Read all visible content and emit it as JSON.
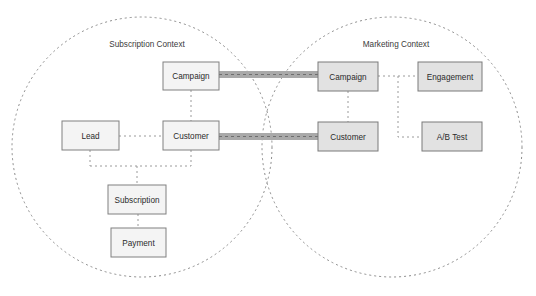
{
  "diagram": {
    "background_color": "#ffffff",
    "contexts": [
      {
        "id": "subscription-context",
        "label": "Subscription Context",
        "cx": 142,
        "cy": 147,
        "r": 130,
        "label_x": 147,
        "label_y": 45
      },
      {
        "id": "marketing-context",
        "label": "Marketing Context",
        "cx": 392,
        "cy": 147,
        "r": 130,
        "label_x": 396,
        "label_y": 45
      }
    ],
    "nodes": [
      {
        "id": "subscription-campaign",
        "label": "Campaign",
        "context": "subscription-context",
        "x": 163,
        "y": 62,
        "w": 56,
        "h": 28,
        "style": "light"
      },
      {
        "id": "subscription-lead",
        "label": "Lead",
        "context": "subscription-context",
        "x": 62,
        "y": 121,
        "w": 57,
        "h": 29,
        "style": "light"
      },
      {
        "id": "subscription-customer",
        "label": "Customer",
        "context": "subscription-context",
        "x": 163,
        "y": 121,
        "w": 56,
        "h": 29,
        "style": "light"
      },
      {
        "id": "subscription-subscription",
        "label": "Subscription",
        "context": "subscription-context",
        "x": 108,
        "y": 185,
        "w": 58,
        "h": 29,
        "style": "light"
      },
      {
        "id": "subscription-payment",
        "label": "Payment",
        "context": "subscription-context",
        "x": 111,
        "y": 228,
        "w": 55,
        "h": 29,
        "style": "light"
      },
      {
        "id": "marketing-campaign",
        "label": "Campaign",
        "context": "marketing-context",
        "x": 318,
        "y": 62,
        "w": 60,
        "h": 29,
        "style": "dark"
      },
      {
        "id": "marketing-engagement",
        "label": "Engagement",
        "context": "marketing-context",
        "x": 418,
        "y": 62,
        "w": 64,
        "h": 29,
        "style": "dark"
      },
      {
        "id": "marketing-customer",
        "label": "Customer",
        "context": "marketing-context",
        "x": 318,
        "y": 122,
        "w": 60,
        "h": 29,
        "style": "dark"
      },
      {
        "id": "marketing-abtest",
        "label": "A/B Test",
        "context": "marketing-context",
        "x": 422,
        "y": 122,
        "w": 60,
        "h": 29,
        "style": "dark"
      }
    ],
    "links": [
      {
        "id": "link-campaign-customer-left",
        "from": "subscription-campaign",
        "to": "subscription-customer",
        "kind": "dashed",
        "path": "M 191 90 L 191 121"
      },
      {
        "id": "link-lead-customer",
        "from": "subscription-lead",
        "to": "subscription-customer",
        "kind": "dashed",
        "path": "M 119 136 L 163 136"
      },
      {
        "id": "link-lead-bus",
        "from": "subscription-lead",
        "to": "bus",
        "kind": "dashed",
        "path": "M 90 150 L 90 166"
      },
      {
        "id": "link-customer-bus",
        "from": "subscription-customer",
        "to": "bus",
        "kind": "dashed",
        "path": "M 191 150 L 191 166"
      },
      {
        "id": "link-bus-horizontal",
        "from": "bus",
        "to": "bus",
        "kind": "dashed",
        "path": "M 90 166 L 191 166"
      },
      {
        "id": "link-bus-subscription",
        "from": "bus",
        "to": "subscription-subscription",
        "kind": "dashed",
        "path": "M 137 166 L 137 185"
      },
      {
        "id": "link-subscription-payment",
        "from": "subscription-subscription",
        "to": "subscription-payment",
        "kind": "dashed",
        "path": "M 138 214 L 138 228"
      },
      {
        "id": "link-marketing-campaign-customer",
        "from": "marketing-campaign",
        "to": "marketing-customer",
        "kind": "dashed",
        "path": "M 348 91 L 348 122"
      },
      {
        "id": "link-campaign-engagement",
        "from": "marketing-campaign",
        "to": "marketing-engagement",
        "kind": "dashed",
        "path": "M 378 76 L 418 76"
      },
      {
        "id": "link-engagement-branch",
        "from": "marketing-engagement",
        "to": "marketing-abtest",
        "kind": "dashed",
        "path": "M 398 76 L 398 137 L 422 137"
      }
    ],
    "relationship_bands": [
      {
        "id": "band-campaign-to-campaign",
        "from": "subscription-campaign",
        "to": "marketing-campaign",
        "x": 219,
        "y": 71,
        "w": 99,
        "h": 7,
        "dash_y": 74.5
      },
      {
        "id": "band-customer-to-customer",
        "from": "subscription-customer",
        "to": "marketing-customer",
        "x": 219,
        "y": 133,
        "w": 99,
        "h": 7,
        "dash_y": 136.5
      }
    ],
    "colors": {
      "circle_stroke": "#8c8c8c",
      "node_light_fill": "#f4f4f4",
      "node_dark_fill": "#e2e2e2",
      "node_stroke": "#808080",
      "link_stroke": "#9a9a9a",
      "band_fill": "#a9a9a9",
      "text": "#2b2b2b"
    }
  }
}
